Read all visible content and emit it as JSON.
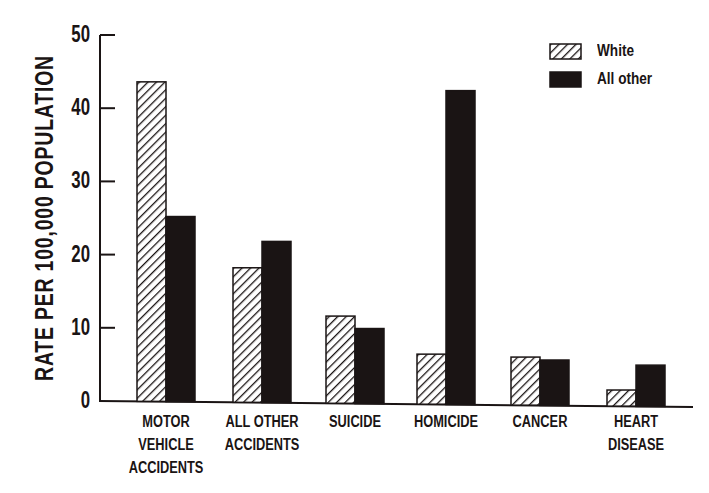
{
  "chart_data": {
    "type": "bar",
    "title": "",
    "xlabel": "",
    "ylabel": "RATE PER 100,000 POPULATION",
    "ylim": [
      0,
      50
    ],
    "yticks": [
      0,
      10,
      20,
      30,
      40,
      50
    ],
    "grid": false,
    "legend_position": "top-right",
    "categories": [
      "MOTOR VEHICLE ACCIDENTS",
      "ALL OTHER ACCIDENTS",
      "SUICIDE",
      "HOMICIDE",
      "CANCER",
      "HEART DISEASE"
    ],
    "category_labels": [
      "MOTOR\nVEHICLE\nACCIDENTS",
      "ALL OTHER\nACCIDENTS",
      "SUICIDE",
      "HOMICIDE",
      "CANCER",
      "HEART\nDISEASE"
    ],
    "series": [
      {
        "name": "White",
        "pattern": "hatched",
        "values": [
          43.6,
          18.2,
          11.6,
          6.4,
          6.0,
          1.5
        ]
      },
      {
        "name": "All other",
        "pattern": "solid",
        "values": [
          25.2,
          21.8,
          9.9,
          42.4,
          5.6,
          4.9
        ]
      }
    ]
  },
  "colors": {
    "ink": "#1a1414",
    "background": "#ffffff"
  }
}
